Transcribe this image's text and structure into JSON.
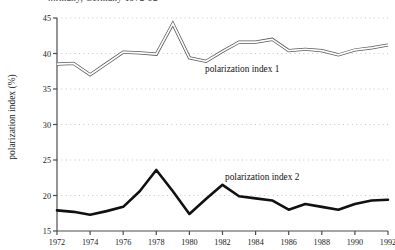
{
  "chart_data": {
    "type": "line",
    "title": "...rmany, Germany 1972-92",
    "title_clipped": true,
    "xlabel": "",
    "ylabel": "polarization index (%)",
    "xlim": [
      1972,
      1992
    ],
    "ylim": [
      15,
      45
    ],
    "yticks": [
      15,
      20,
      25,
      30,
      35,
      40,
      45
    ],
    "xticks": [
      1972,
      1974,
      1976,
      1978,
      1980,
      1982,
      1984,
      1986,
      1988,
      1990,
      1992
    ],
    "grid": true,
    "grid_style": "dotted",
    "grid_color": "#bfbfbf",
    "legend_position": "inline-annotation",
    "x": [
      1972,
      1973,
      1974,
      1975,
      1976,
      1977,
      1978,
      1979,
      1980,
      1981,
      1982,
      1983,
      1984,
      1985,
      1986,
      1987,
      1988,
      1989,
      1990,
      1991,
      1992
    ],
    "series": [
      {
        "name": "polarization index 1",
        "style": "double-line",
        "color": "#5a5a5a",
        "values": [
          38.5,
          38.6,
          37.0,
          38.6,
          40.2,
          40.1,
          39.9,
          44.2,
          39.4,
          38.9,
          40.3,
          41.6,
          41.6,
          42.0,
          40.4,
          40.6,
          40.4,
          39.8,
          40.5,
          40.8,
          41.2
        ]
      },
      {
        "name": "polarization index 2",
        "style": "thick-solid",
        "color": "#111111",
        "values": [
          17.9,
          17.7,
          17.3,
          17.8,
          18.4,
          20.6,
          23.6,
          20.6,
          17.4,
          19.5,
          21.5,
          19.9,
          19.6,
          19.3,
          18.0,
          18.8,
          18.4,
          18.0,
          18.8,
          19.3,
          19.4
        ]
      }
    ],
    "annotations": [
      {
        "text": "polarization index 1",
        "x": 1981,
        "y": 37.3
      },
      {
        "text": "polarization index 2",
        "x": 1983,
        "y": 22.1
      }
    ]
  }
}
